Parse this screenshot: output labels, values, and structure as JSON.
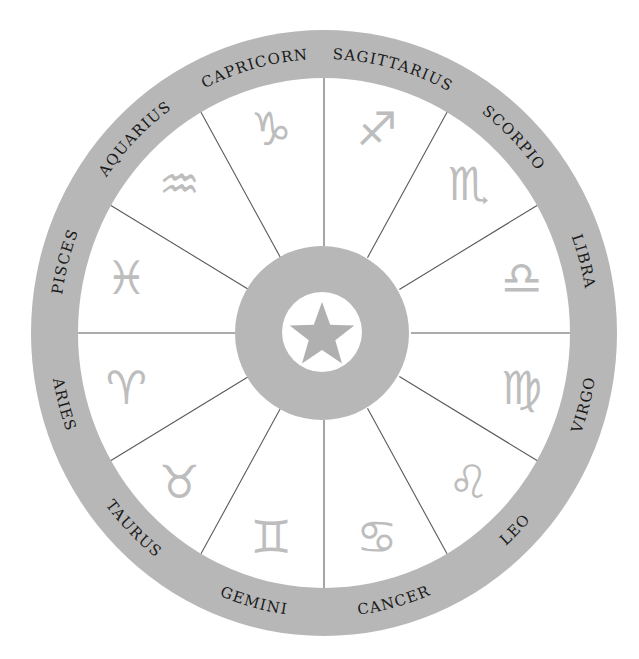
{
  "diagram": {
    "center_icon": "star-icon",
    "colors": {
      "background": "#ffffff",
      "ring": "#b7b7b7",
      "spoke": "#5a5a5a",
      "glyph": "#bdbdbd",
      "label": "#1a1a1a",
      "center_disc": "#b7b7b7",
      "center_inner": "#ffffff",
      "star": "#b0b0b0"
    },
    "geometry": {
      "cx": 324,
      "cy": 333,
      "outer_rx": 293,
      "outer_ry": 303,
      "inner_rx": 246,
      "inner_ry": 255,
      "hub_r": 87,
      "hub_inner_r": 40
    },
    "signs": [
      {
        "name": "Sagittarius",
        "symbol": "♐",
        "icon": "sagittarius-icon",
        "center_angle": -75
      },
      {
        "name": "Scorpio",
        "symbol": "♏",
        "icon": "scorpio-icon",
        "center_angle": -45
      },
      {
        "name": "Libra",
        "symbol": "♎",
        "icon": "libra-icon",
        "center_angle": -15
      },
      {
        "name": "Virgo",
        "symbol": "♍",
        "icon": "virgo-icon",
        "center_angle": 15
      },
      {
        "name": "Leo",
        "symbol": "♌",
        "icon": "leo-icon",
        "center_angle": 45
      },
      {
        "name": "Cancer",
        "symbol": "♋",
        "icon": "cancer-icon",
        "center_angle": 75
      },
      {
        "name": "Gemini",
        "symbol": "♊",
        "icon": "gemini-icon",
        "center_angle": 105
      },
      {
        "name": "Taurus",
        "symbol": "♉",
        "icon": "taurus-icon",
        "center_angle": 135
      },
      {
        "name": "Aries",
        "symbol": "♈",
        "icon": "aries-icon",
        "center_angle": 165
      },
      {
        "name": "Pisces",
        "symbol": "♓",
        "icon": "pisces-icon",
        "center_angle": -165
      },
      {
        "name": "Aquarius",
        "symbol": "♒",
        "icon": "aquarius-icon",
        "center_angle": -135
      },
      {
        "name": "Capricorn",
        "symbol": "♑",
        "icon": "capricorn-icon",
        "center_angle": -105
      }
    ]
  }
}
